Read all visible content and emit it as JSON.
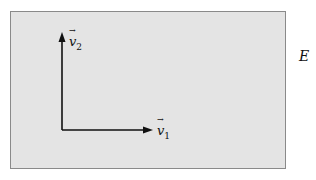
{
  "diagram": {
    "space_label": "E",
    "vectors": [
      {
        "name": "v",
        "subscript": "1",
        "direction": "horizontal"
      },
      {
        "name": "v",
        "subscript": "2",
        "direction": "vertical"
      }
    ],
    "colors": {
      "plane_fill": "#e4e4e4",
      "plane_border": "#8a8a8a",
      "arrow": "#111111"
    }
  }
}
